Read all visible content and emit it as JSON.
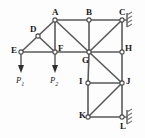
{
  "figure": {
    "type": "truss-structure-diagram",
    "background_color": "#fdfdfd",
    "member_color": "#5a5a5a",
    "label_color": "#1b1b1b",
    "width": 145,
    "height": 138
  },
  "nodes": [
    {
      "id": "A",
      "label": "A",
      "x": 55,
      "y": 20,
      "label_x": 52,
      "label_y": 8
    },
    {
      "id": "B",
      "label": "B",
      "x": 89,
      "y": 20,
      "label_x": 86,
      "label_y": 8
    },
    {
      "id": "C",
      "label": "C",
      "x": 122,
      "y": 20,
      "label_x": 119,
      "label_y": 8
    },
    {
      "id": "D",
      "label": "D",
      "x": 38,
      "y": 36,
      "label_x": 30,
      "label_y": 25
    },
    {
      "id": "E",
      "label": "E",
      "x": 21,
      "y": 52,
      "label_x": 11,
      "label_y": 46
    },
    {
      "id": "F",
      "label": "F",
      "x": 55,
      "y": 52,
      "label_x": 58,
      "label_y": 44
    },
    {
      "id": "G",
      "label": "G",
      "x": 89,
      "y": 52,
      "label_x": 82,
      "label_y": 56
    },
    {
      "id": "H",
      "label": "H",
      "x": 122,
      "y": 52,
      "label_x": 125,
      "label_y": 44
    },
    {
      "id": "I",
      "label": "I",
      "x": 88,
      "y": 83,
      "label_x": 79,
      "label_y": 77
    },
    {
      "id": "J",
      "label": "J",
      "x": 122,
      "y": 83,
      "label_x": 126,
      "label_y": 77
    },
    {
      "id": "K",
      "label": "K",
      "x": 88,
      "y": 117,
      "label_x": 79,
      "label_y": 111
    },
    {
      "id": "L",
      "label": "L",
      "x": 122,
      "y": 117,
      "label_x": 120,
      "label_y": 122
    }
  ],
  "members": [
    {
      "from": "A",
      "to": "B"
    },
    {
      "from": "B",
      "to": "C"
    },
    {
      "from": "A",
      "to": "D"
    },
    {
      "from": "D",
      "to": "E"
    },
    {
      "from": "D",
      "to": "F"
    },
    {
      "from": "E",
      "to": "F"
    },
    {
      "from": "A",
      "to": "F"
    },
    {
      "from": "A",
      "to": "G"
    },
    {
      "from": "B",
      "to": "G"
    },
    {
      "from": "C",
      "to": "G"
    },
    {
      "from": "C",
      "to": "H"
    },
    {
      "from": "F",
      "to": "G"
    },
    {
      "from": "G",
      "to": "H"
    },
    {
      "from": "G",
      "to": "I"
    },
    {
      "from": "G",
      "to": "J"
    },
    {
      "from": "H",
      "to": "J"
    },
    {
      "from": "I",
      "to": "J"
    },
    {
      "from": "I",
      "to": "K"
    },
    {
      "from": "K",
      "to": "J"
    },
    {
      "from": "K",
      "to": "L"
    },
    {
      "from": "J",
      "to": "L"
    }
  ],
  "loads": [
    {
      "id": "P1",
      "label": "P",
      "subscript": "1",
      "at_node": "E",
      "direction": "down",
      "x": 21,
      "y_start": 54,
      "y_end": 72,
      "label_x": 16,
      "label_y": 76
    },
    {
      "id": "P2",
      "label": "P",
      "subscript": "2",
      "at_node": "F",
      "direction": "down",
      "x": 55,
      "y_start": 54,
      "y_end": 72,
      "label_x": 50,
      "label_y": 76
    }
  ],
  "supports": [
    {
      "id": "support-c",
      "at_node": "C",
      "side": "right",
      "type": "hatched-wall",
      "x": 124,
      "y": 20
    },
    {
      "id": "support-l",
      "at_node": "L",
      "side": "right",
      "type": "hatched-wall",
      "x": 124,
      "y": 117
    }
  ]
}
